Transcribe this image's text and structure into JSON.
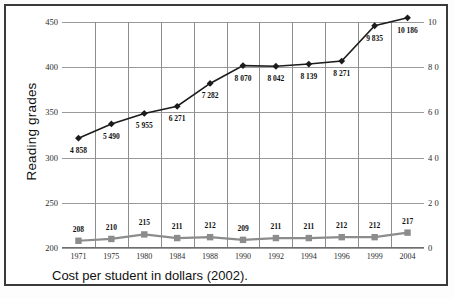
{
  "figure": {
    "caption": "Cost per student in dollars (2002).",
    "y_axis_title": "Reading grades"
  },
  "chart_data": {
    "type": "line",
    "title": "",
    "xlabel": "",
    "ylabel": "Reading grades",
    "ylabel_right": "Cost per student in dollars (2002)",
    "categories": [
      "1971",
      "1975",
      "1980",
      "1984",
      "1988",
      "1990",
      "1992",
      "1994",
      "1996",
      "1999",
      "2004"
    ],
    "grid": true,
    "legend": "none",
    "yticks_left": [
      "200",
      "250",
      "300",
      "350",
      "400",
      "450"
    ],
    "ylim_left": [
      200,
      450
    ],
    "yticks_right": [
      "0",
      "2 0",
      "4 0",
      "6 0",
      "8 0",
      "10"
    ],
    "yticks_right_full": [
      "0",
      "2 000",
      "4 000",
      "6 000",
      "8 000",
      "10 000"
    ],
    "ylim_right": [
      0,
      10000
    ],
    "series": [
      {
        "name": "Cost per student",
        "axis": "right",
        "color": "#1b1b1b",
        "marker": "diamond",
        "values": [
          4858,
          5490,
          5955,
          6271,
          7282,
          8070,
          8042,
          8139,
          8271,
          9835,
          10186
        ],
        "labels": [
          "4 858",
          "5 490",
          "5 955",
          "6 271",
          "7 282",
          "8 070",
          "8 042",
          "8 139",
          "8 271",
          "9 835",
          "10 186"
        ]
      },
      {
        "name": "Reading grades",
        "axis": "left",
        "color": "#8c8c8c",
        "marker": "square",
        "values": [
          208,
          210,
          215,
          211,
          212,
          209,
          211,
          211,
          212,
          212,
          217
        ],
        "labels": [
          "208",
          "210",
          "215",
          "211",
          "212",
          "209",
          "211",
          "211",
          "212",
          "212",
          "217"
        ]
      }
    ]
  }
}
